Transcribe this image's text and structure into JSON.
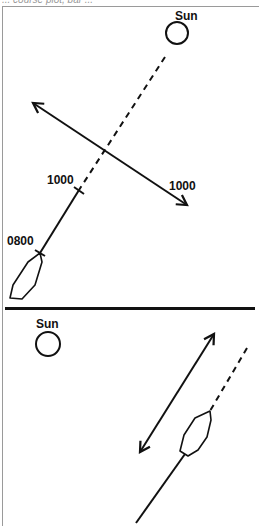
{
  "caption": "... course plot, bar ...",
  "top_panel": {
    "sun_label": "Sun",
    "course_time_label_lower": "0800",
    "course_time_label_upper": "1000",
    "bearing_line_label": "1000"
  },
  "bottom_panel": {
    "sun_label": "Sun"
  },
  "colors": {
    "ink": "#111111",
    "frame": "#9a9a9a",
    "background": "#ffffff"
  }
}
